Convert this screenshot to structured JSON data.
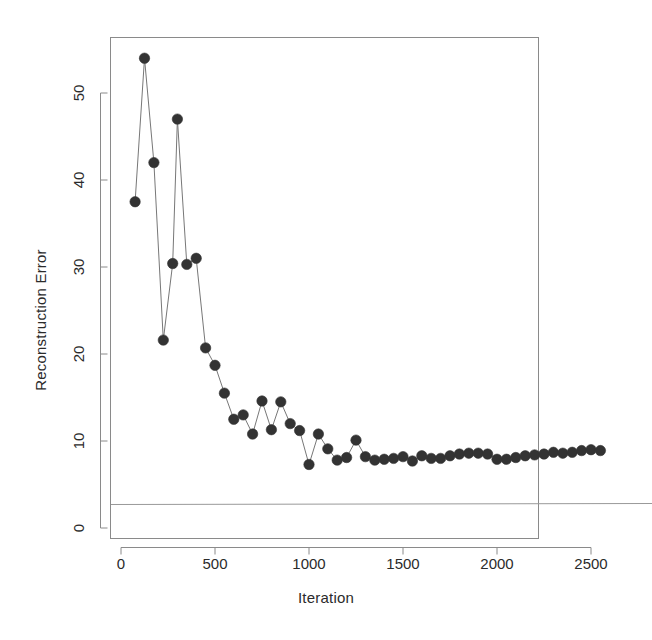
{
  "chart_data": {
    "type": "line",
    "title": "",
    "xlabel": "Iteration",
    "ylabel": "Reconstruction Error",
    "xlim": [
      -60,
      2620
    ],
    "ylim": [
      -1.5,
      56.5
    ],
    "xticks": [
      0,
      500,
      1000,
      1500,
      2000,
      2500
    ],
    "xtick_labels": [
      "0",
      "500",
      "1000",
      "1500",
      "2000",
      "2500"
    ],
    "yticks": [
      0,
      10,
      20,
      30,
      40,
      50
    ],
    "ytick_labels": [
      "0",
      "10",
      "20",
      "30",
      "40",
      "50"
    ],
    "grid": false,
    "legend": null,
    "marker": "filled-circle",
    "marker_color": "#333333",
    "line_color": "#777777",
    "frame": true,
    "reference_line": {
      "orientation": "horizontal",
      "y": 2.7,
      "color": "#999999"
    },
    "x": [
      75,
      125,
      175,
      225,
      275,
      300,
      350,
      400,
      450,
      500,
      550,
      600,
      650,
      700,
      750,
      800,
      850,
      900,
      950,
      1000,
      1050,
      1100,
      1150,
      1200,
      1250,
      1300,
      1350,
      1400,
      1450,
      1500,
      1550,
      1600,
      1650,
      1700,
      1750,
      1800,
      1850,
      1900,
      1950,
      2000,
      2050,
      2100,
      2150,
      2200,
      2250,
      2300,
      2350,
      2400,
      2450,
      2500,
      2550
    ],
    "y": [
      37.5,
      54.0,
      42.0,
      21.6,
      30.4,
      47.0,
      30.3,
      31.0,
      20.7,
      18.7,
      15.5,
      12.5,
      13.0,
      10.8,
      14.6,
      11.3,
      14.5,
      12.0,
      11.2,
      7.3,
      10.8,
      9.1,
      7.8,
      8.1,
      10.1,
      8.2,
      7.8,
      7.9,
      8.0,
      8.2,
      7.7,
      8.3,
      8.0,
      8.0,
      8.3,
      8.5,
      8.6,
      8.6,
      8.5,
      7.9,
      7.9,
      8.1,
      8.3,
      8.4,
      8.5,
      8.7,
      8.6,
      8.7,
      8.9,
      9.0,
      8.9
    ],
    "point_count": 51,
    "series_name": "Reconstruction Error"
  }
}
